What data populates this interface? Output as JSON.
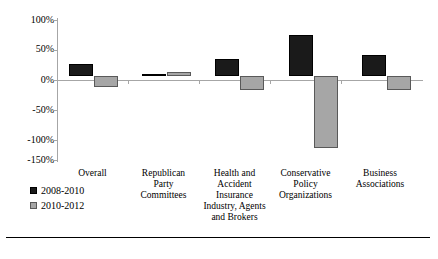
{
  "chart_data": {
    "type": "bar",
    "title": "",
    "subtitle": "",
    "xlabel": "",
    "ylabel": "",
    "ylim": [
      -150,
      100
    ],
    "grid": false,
    "legend_position": "bottom-left",
    "ytick_labels": [
      "100%",
      "50%",
      "0%",
      "-50%",
      "-100%",
      "-150%"
    ],
    "ytick_values": [
      100,
      50,
      0,
      -50,
      -100,
      -150
    ],
    "categories": [
      "Overall",
      "Republican Party Committees",
      "Health and Accident Insurance Industry, Agents and Brokers",
      "Conservative Policy Organizations",
      "Business Associations"
    ],
    "category_lines": [
      [
        "Overall"
      ],
      [
        "Republican",
        "Party",
        "Committees"
      ],
      [
        "Health and",
        "Accident",
        "Insurance",
        "Industry, Agents",
        "and Brokers"
      ],
      [
        "Conservative",
        "Policy",
        "Organizations"
      ],
      [
        "Business",
        "Associations"
      ]
    ],
    "series": [
      {
        "name": "2008-2010",
        "color": "#1a1a1a",
        "values": [
          20,
          2,
          28,
          70,
          35
        ]
      },
      {
        "name": "2010-2012",
        "color": "#a6a6a6",
        "values": [
          -20,
          6,
          -25,
          -125,
          -25
        ]
      }
    ]
  },
  "legend": {
    "items": [
      {
        "label": "2008-2010",
        "swatch": "black-square-icon"
      },
      {
        "label": "2010-2012",
        "swatch": "gray-square-icon"
      }
    ]
  }
}
